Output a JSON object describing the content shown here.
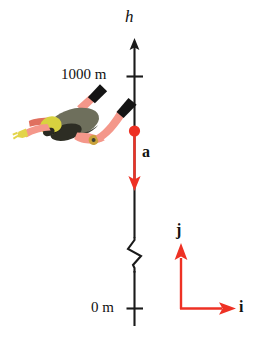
{
  "figure": {
    "background_color": "#ffffff",
    "axis_color": "#1a1a1a",
    "vector_color": "#ee3124",
    "label_color": "#111111"
  },
  "height_axis": {
    "name": "h",
    "arrow_direction": "up",
    "has_break_symbol": true,
    "ticks": [
      {
        "label": "1000 m",
        "value": 1000,
        "unit": "m"
      },
      {
        "label": "0 m",
        "value": 0,
        "unit": "m"
      }
    ]
  },
  "acceleration_vector": {
    "label": "a",
    "direction": "down",
    "color": "#ee3124",
    "origin_marker": "filled-dot"
  },
  "basis_vectors": [
    {
      "label": "j",
      "direction": "up",
      "color": "#ee3124"
    },
    {
      "label": "i",
      "direction": "right",
      "color": "#ee3124"
    }
  ],
  "skydiver": {
    "name": "skydiver",
    "suit_color": "#f4978a",
    "suit_shadow_color": "#e0705f",
    "pack_color": "#6e6f5c",
    "pack_dark_color": "#3f4034",
    "helmet_color": "#d8d23f",
    "boot_color": "#141414",
    "glove_color": "#e3d44a"
  }
}
